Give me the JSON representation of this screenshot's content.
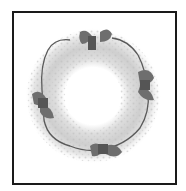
{
  "image": {
    "subject": "lace wreath with four ribbon bows",
    "alt": "White lace wreath with wire outline and four grey ribbon bows, framed by a black square border",
    "colors": {
      "background": "#ffffff",
      "frame": "#1a1a1a",
      "lace": "#d8d8d8",
      "lace_shadow": "#b5b5b5",
      "wire": "#555555",
      "bow": "#6e6e6e",
      "bow_dark": "#4a4a4a"
    },
    "bows": [
      {
        "position": "top",
        "x": 93,
        "y": 38
      },
      {
        "position": "right",
        "x": 147,
        "y": 84
      },
      {
        "position": "bottom",
        "x": 105,
        "y": 150
      },
      {
        "position": "left",
        "x": 42,
        "y": 104
      }
    ]
  }
}
